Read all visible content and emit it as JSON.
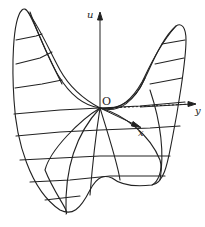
{
  "diagram": {
    "type": "saddle-surface",
    "axes": {
      "u": {
        "label": "u"
      },
      "y": {
        "label": "y"
      },
      "x": {
        "label": "x"
      }
    },
    "origin_label": "O",
    "stroke_color": "#222222",
    "background": "#ffffff"
  }
}
